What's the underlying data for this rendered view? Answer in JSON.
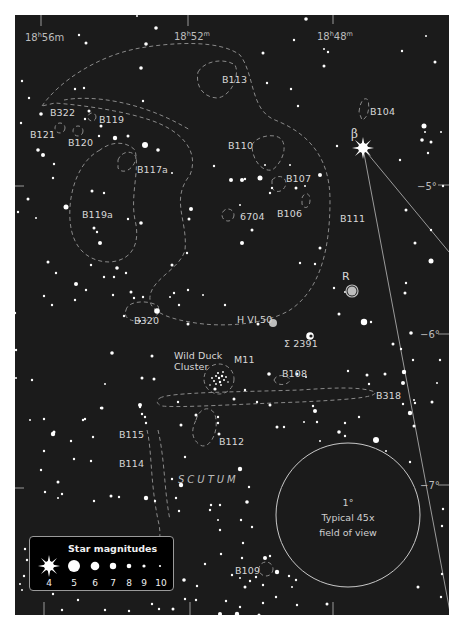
{
  "map": {
    "ra_labels": [
      {
        "h": "18",
        "m": "56",
        "m_unit": "m",
        "x": 25,
        "y": 32
      },
      {
        "h": "18",
        "m": "52",
        "m_unit": "m",
        "x": 174,
        "y": 31
      },
      {
        "h": "18",
        "m": "48",
        "m_unit": "m",
        "x": 317,
        "y": 31
      }
    ],
    "dec_labels": [
      {
        "text": "−5°",
        "x": 418,
        "y": 182
      },
      {
        "text": "−6°",
        "x": 421,
        "y": 330
      },
      {
        "text": "−7°",
        "x": 421,
        "y": 481
      }
    ],
    "constellation": {
      "text": "SCUTUM",
      "x": 178,
      "y": 473
    },
    "objects": [
      {
        "id": "B113",
        "text": "B113",
        "x": 222,
        "y": 74
      },
      {
        "id": "B104",
        "text": "B104",
        "x": 370,
        "y": 107
      },
      {
        "id": "B322",
        "text": "B322",
        "x": 50,
        "y": 108
      },
      {
        "id": "B119",
        "text": "B119",
        "x": 99,
        "y": 115
      },
      {
        "id": "B121",
        "text": "B121",
        "x": 30,
        "y": 130
      },
      {
        "id": "B120",
        "text": "B120",
        "x": 68,
        "y": 138
      },
      {
        "id": "B110",
        "text": "B110",
        "x": 228,
        "y": 141
      },
      {
        "id": "B117a",
        "text": "B117a",
        "x": 137,
        "y": 165
      },
      {
        "id": "B107",
        "text": "B107",
        "x": 286,
        "y": 174
      },
      {
        "id": "B119a",
        "text": "B119a",
        "x": 82,
        "y": 210
      },
      {
        "id": "NGC6704",
        "text": "6704",
        "x": 240,
        "y": 212
      },
      {
        "id": "B106",
        "text": "B106",
        "x": 277,
        "y": 209
      },
      {
        "id": "B111",
        "text": "B111",
        "x": 340,
        "y": 214
      },
      {
        "id": "R",
        "text": "R",
        "x": 342,
        "y": 271
      },
      {
        "id": "B320",
        "text": "B320",
        "x": 134,
        "y": 316
      },
      {
        "id": "HVI50",
        "text": "H VI 50",
        "x": 237,
        "y": 315
      },
      {
        "id": "STF2391",
        "text": "Σ 2391",
        "x": 284,
        "y": 339
      },
      {
        "id": "WildDuck",
        "text": "Wild Duck",
        "x": 174,
        "y": 351
      },
      {
        "id": "WildDuck2",
        "text": "Cluster",
        "x": 174,
        "y": 362
      },
      {
        "id": "M11",
        "text": "M11",
        "x": 234,
        "y": 355
      },
      {
        "id": "B108",
        "text": "B108",
        "x": 282,
        "y": 369
      },
      {
        "id": "B318",
        "text": "B318",
        "x": 376,
        "y": 391
      },
      {
        "id": "B115",
        "text": "B115",
        "x": 119,
        "y": 430
      },
      {
        "id": "B112",
        "text": "B112",
        "x": 219,
        "y": 437
      },
      {
        "id": "B114",
        "text": "B114",
        "x": 119,
        "y": 459
      },
      {
        "id": "B109",
        "text": "B109",
        "x": 235,
        "y": 566
      }
    ],
    "beta_label": {
      "text": "β",
      "x": 351,
      "y": 128
    },
    "fov": {
      "line1": "1°",
      "line2": "Typical 45x",
      "line3": "field of view"
    }
  },
  "legend": {
    "title": "Star magnitudes",
    "magnitudes": [
      "4",
      "5",
      "6",
      "7",
      "8",
      "9",
      "10"
    ]
  },
  "colors": {
    "background": "#1b1b1b",
    "star": "#ffffff",
    "dashed_outline": "#8a8a8a",
    "label": "#d8d8d8"
  }
}
